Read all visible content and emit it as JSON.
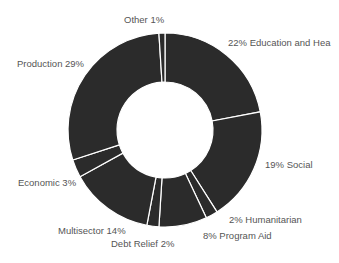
{
  "chart_data": {
    "type": "pie",
    "variant": "donut",
    "title": "",
    "start_angle_deg": 0,
    "direction": "clockwise",
    "slice_color": "#2b2b2b",
    "separator_color": "#ffffff",
    "label_color": "#555555",
    "slices": [
      {
        "name": "Education and Hea",
        "value": 22,
        "label": "22% Education and Hea"
      },
      {
        "name": "Social",
        "value": 19,
        "label": "19% Social"
      },
      {
        "name": "Humanitarian",
        "value": 2,
        "label": "2% Humanitarian"
      },
      {
        "name": "Program Aid",
        "value": 8,
        "label": "8% Program Aid"
      },
      {
        "name": "Debt Relief",
        "value": 2,
        "label": "Debt Relief 2%"
      },
      {
        "name": "Multisector",
        "value": 14,
        "label": "Multisector 14%"
      },
      {
        "name": "Economic",
        "value": 3,
        "label": "Economic 3%"
      },
      {
        "name": "Production",
        "value": 29,
        "label": "Production 29%"
      },
      {
        "name": "Other",
        "value": 1,
        "label": "Other 1%"
      }
    ]
  },
  "labels": {
    "education": "22% Education and Hea",
    "social": "19% Social",
    "humanitarian": "2% Humanitarian",
    "program_aid": "8% Program Aid",
    "debt_relief": "Debt Relief 2%",
    "multisector": "Multisector 14%",
    "economic": "Economic 3%",
    "production": "Production 29%",
    "other": "Other 1%"
  }
}
